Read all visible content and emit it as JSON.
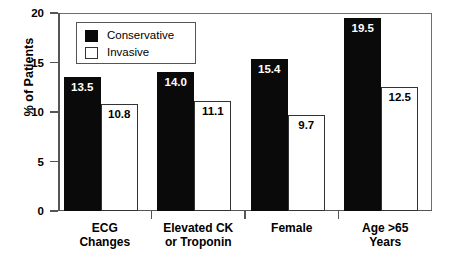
{
  "chart_data": {
    "type": "bar",
    "title": "",
    "xlabel": "",
    "ylabel": "% of Patients",
    "ylim": [
      0,
      20
    ],
    "yticks": [
      0,
      5,
      10,
      15,
      20
    ],
    "grid": false,
    "legend_position": "upper-left-inside",
    "categories": [
      "ECG\nChanges",
      "Elevated CK\nor Troponin",
      "Female",
      "Age >65\nYears"
    ],
    "series": [
      {
        "name": "Conservative",
        "color": "#0a0a0a",
        "values": [
          13.5,
          14.0,
          15.4,
          19.5
        ],
        "labels": [
          "13.5",
          "14.0",
          "15.4",
          "19.5"
        ]
      },
      {
        "name": "Invasive",
        "color": "#ffffff",
        "values": [
          10.8,
          11.1,
          9.7,
          12.5
        ],
        "labels": [
          "10.8",
          "11.1",
          "9.7",
          "12.5"
        ]
      }
    ]
  },
  "axis": {
    "y_tick_labels": [
      "0",
      "5",
      "10",
      "15",
      "20"
    ],
    "y_axis_title": "% of Patients"
  },
  "legend": {
    "items": [
      {
        "label": "Conservative",
        "swatch": "filled-square-icon"
      },
      {
        "label": "Invasive",
        "swatch": "open-square-icon"
      }
    ]
  }
}
